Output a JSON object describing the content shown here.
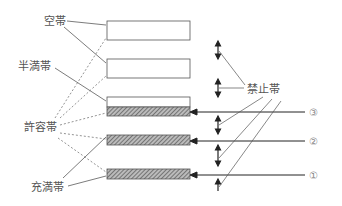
{
  "labels": {
    "empty_band": "空帯",
    "half_full_band": "半満帯",
    "allowed_band": "許容帯",
    "full_band": "充満帯",
    "forbidden_band": "禁止帯"
  },
  "markers": [
    "③",
    "②",
    "①"
  ],
  "colors": {
    "line": "#333333",
    "hatch": "#555555",
    "text": "#555555"
  }
}
